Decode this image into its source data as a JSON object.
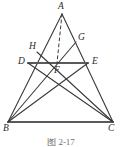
{
  "figure": {
    "caption": "图 2-17",
    "stroke_color": "#3a3a3a",
    "thick_stroke_color": "#5a5a5a",
    "label_color": "#2b2b2b",
    "background": "#ffffff",
    "points": [
      {
        "id": "A",
        "label": "A",
        "x": 62,
        "y": 14,
        "label_x": 58,
        "label_y": 2
      },
      {
        "id": "B",
        "label": "B",
        "x": 8,
        "y": 122,
        "label_x": 3,
        "label_y": 124
      },
      {
        "id": "C",
        "label": "C",
        "x": 113,
        "y": 122,
        "label_x": 108,
        "label_y": 124
      },
      {
        "id": "D",
        "label": "D",
        "x": 28,
        "y": 63,
        "label_x": 18,
        "label_y": 57
      },
      {
        "id": "E",
        "label": "E",
        "x": 88,
        "y": 63,
        "label_x": 92,
        "label_y": 57
      },
      {
        "id": "F",
        "label": "F",
        "x": 57,
        "y": 63,
        "label_x": 54,
        "label_y": 66
      },
      {
        "id": "G",
        "label": "G",
        "x": 76,
        "y": 42,
        "label_x": 78,
        "label_y": 33
      },
      {
        "id": "H",
        "label": "H",
        "x": 37,
        "y": 52,
        "label_x": 29,
        "label_y": 42
      }
    ],
    "segments": [
      {
        "name": "side-AB",
        "from": "A",
        "to": "B",
        "style": "solid"
      },
      {
        "name": "side-AC",
        "from": "A",
        "to": "C",
        "style": "solid"
      },
      {
        "name": "side-BC",
        "from": "B",
        "to": "C",
        "style": "solid-thick"
      },
      {
        "name": "segment-DE",
        "from": "D",
        "to": "E",
        "style": "solid-thick"
      },
      {
        "name": "cevian-BG",
        "from": "B",
        "to": "G",
        "style": "solid"
      },
      {
        "name": "cevian-CH",
        "from": "C",
        "to": "H",
        "style": "solid"
      },
      {
        "name": "cevian-CD",
        "from": "C",
        "to": "D",
        "style": "solid"
      },
      {
        "name": "cevian-BE",
        "from": "B",
        "to": "E",
        "style": "solid"
      },
      {
        "name": "altitude-AF",
        "from": "A",
        "to": "F",
        "style": "dashed"
      }
    ]
  }
}
